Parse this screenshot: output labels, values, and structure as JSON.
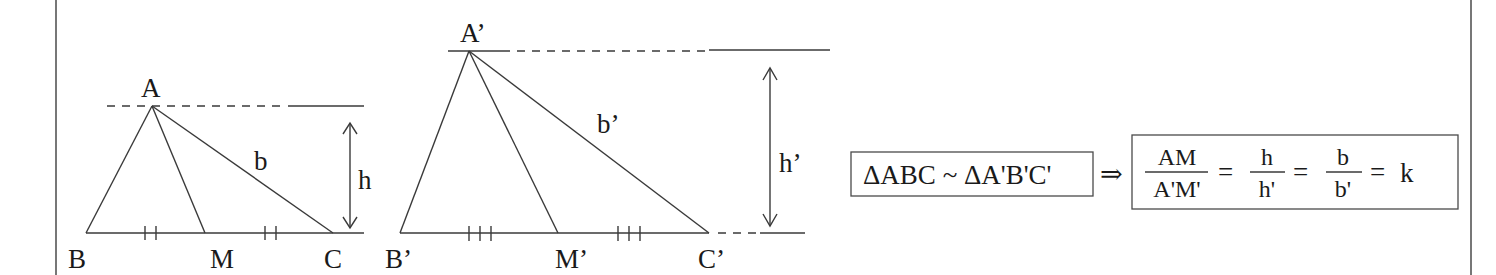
{
  "figure": {
    "triangle1": {
      "vertices": {
        "A": "A",
        "B": "B",
        "C": "C",
        "M": "M"
      },
      "side_label": "b",
      "height_label": "h",
      "tick_marks": "double"
    },
    "triangle2": {
      "vertices": {
        "A": "A’",
        "B": "B’",
        "C": "C’",
        "M": "M’"
      },
      "side_label": "b’",
      "height_label": "h’",
      "tick_marks": "triple"
    },
    "statement": {
      "similarity": "ΔABC ~ ΔA'B'C'",
      "implies": "⇒",
      "ratios": [
        {
          "num": "AM",
          "den": "A'M'"
        },
        {
          "num": "h",
          "den": "h'"
        },
        {
          "num": "b",
          "den": "b'"
        }
      ],
      "equals": "=",
      "constant": "k"
    },
    "colors": {
      "ink": "#1a1a1a",
      "line": "#3a3a3a",
      "frame": "#555555"
    }
  }
}
